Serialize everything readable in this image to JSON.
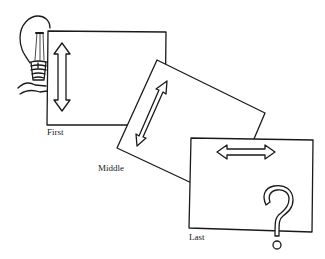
{
  "diagram": {
    "frames": [
      {
        "label": "First",
        "arrow": "vertical-double-arrow"
      },
      {
        "label": "Middle",
        "arrow": "diagonal-double-arrow"
      },
      {
        "label": "Last",
        "arrow": "horizontal-double-arrow",
        "extra": "question-mark"
      }
    ],
    "decoration": "hand-holding-light-bulb",
    "colors": {
      "stroke": "#1a1a1a",
      "background": "#ffffff"
    }
  }
}
